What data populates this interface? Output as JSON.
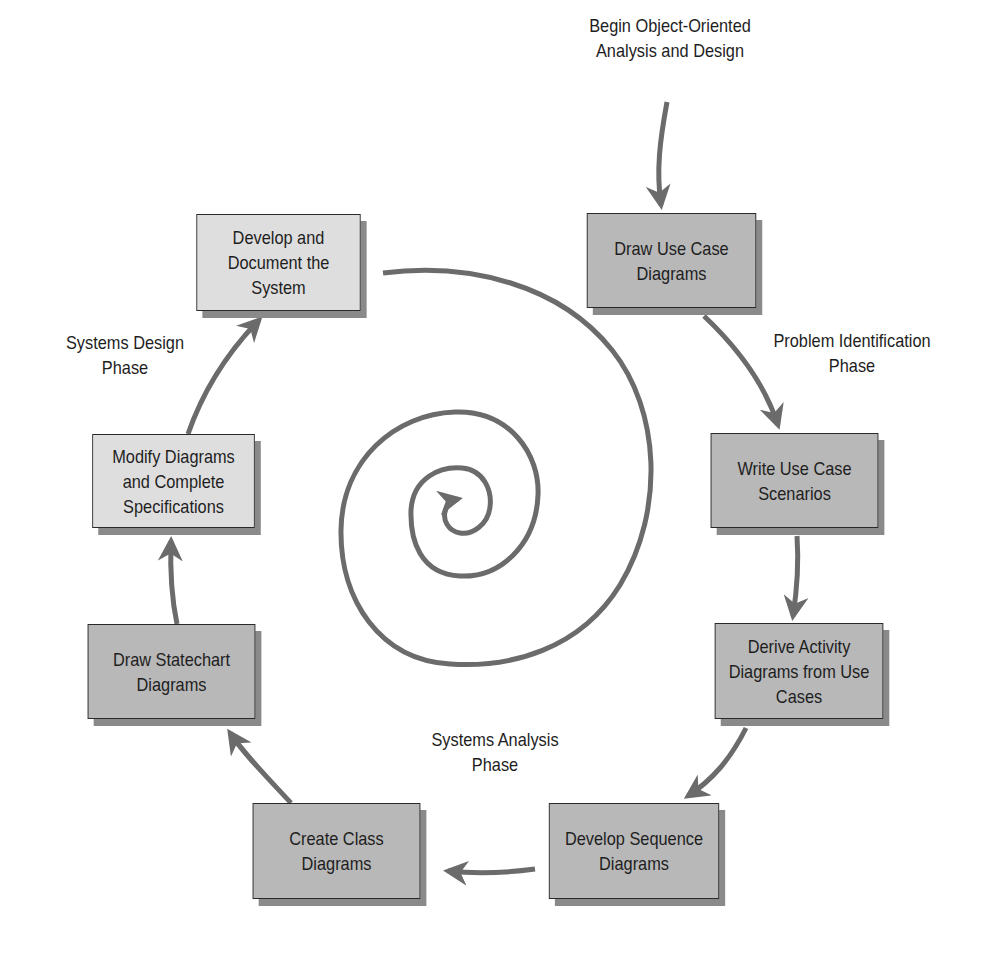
{
  "diagram": {
    "start_label": "Begin Object-Oriented\nAnalysis and Design",
    "phases": {
      "problem_identification": "Problem Identification\nPhase",
      "systems_analysis": "Systems Analysis\nPhase",
      "systems_design": "Systems Design\nPhase"
    },
    "steps": [
      {
        "id": "draw-use-case-diagrams",
        "label": "Draw Use Case Diagrams",
        "shade": "dark",
        "phase": "problem_identification"
      },
      {
        "id": "write-use-case-scenarios",
        "label": "Write Use Case Scenarios",
        "shade": "dark",
        "phase": "problem_identification"
      },
      {
        "id": "derive-activity-diagrams",
        "label": "Derive Activity Diagrams from Use Cases",
        "shade": "dark",
        "phase": "systems_analysis"
      },
      {
        "id": "develop-sequence-diagrams",
        "label": "Develop Sequence Diagrams",
        "shade": "dark",
        "phase": "systems_analysis"
      },
      {
        "id": "create-class-diagrams",
        "label": "Create Class Diagrams",
        "shade": "dark",
        "phase": "systems_analysis"
      },
      {
        "id": "draw-statechart-diagrams",
        "label": "Draw Statechart Diagrams",
        "shade": "dark",
        "phase": "systems_analysis"
      },
      {
        "id": "modify-diagrams",
        "label": "Modify Diagrams and Complete Specifications",
        "shade": "light",
        "phase": "systems_design"
      },
      {
        "id": "develop-document-system",
        "label": "Develop and Document the System",
        "shade": "light",
        "phase": "systems_design"
      }
    ],
    "colors": {
      "dark_box": "#b8b8b8",
      "light_box": "#dedede",
      "arrow": "#6b6b6b",
      "shadow": "#8a8a8a",
      "border": "#2a2a2a"
    }
  }
}
